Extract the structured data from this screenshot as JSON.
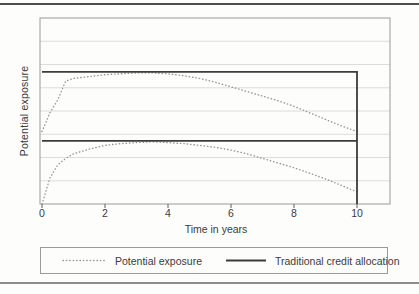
{
  "figure": {
    "y_axis_label": "Potential exposure",
    "x_axis_label": "Time in years"
  },
  "legend": {
    "position": "bottom",
    "items": [
      {
        "label": "Potential exposure",
        "style": "dotted"
      },
      {
        "label": "Traditional credit allocation",
        "style": "solid"
      }
    ]
  },
  "colors": {
    "background": "#fdfdfc",
    "top_rule": "#4d4d4d",
    "bottom_rule": "#8d8d8d",
    "frame": "#9a9a9a",
    "grid": "#dcdcd8",
    "dotted_line": "#979797",
    "solid_line": "#3c3c3c",
    "text": "#3b3b3b"
  },
  "chart_data": {
    "type": "line",
    "title": "",
    "xlabel": "Time in years",
    "ylabel": "Potential exposure",
    "xlim": [
      0,
      11
    ],
    "ylim": [
      0,
      100
    ],
    "x_ticks": [
      0,
      2,
      4,
      6,
      8,
      10
    ],
    "y_axis_numbers_shown": false,
    "y_divisions": 8,
    "grid": "horizontal",
    "legend_position": "bottom",
    "series": [
      {
        "name": "Potential exposure (upper profile)",
        "style": "dotted",
        "x": [
          0,
          0.25,
          0.5,
          0.75,
          1,
          1.5,
          2,
          2.5,
          3,
          3.5,
          4,
          4.5,
          5,
          5.5,
          6,
          6.5,
          7,
          7.5,
          8,
          8.5,
          9,
          9.5,
          10
        ],
        "y": [
          39,
          49,
          56,
          66,
          67.5,
          68.5,
          69.5,
          70,
          70.5,
          70.5,
          70,
          69,
          67.5,
          65.5,
          63,
          60.5,
          58,
          55.5,
          52.5,
          49,
          45.5,
          42,
          39
        ]
      },
      {
        "name": "Potential exposure (lower profile)",
        "style": "dotted",
        "x": [
          0,
          0.25,
          0.5,
          0.75,
          1,
          1.5,
          2,
          2.5,
          3,
          3.5,
          4,
          4.5,
          5,
          5.5,
          6,
          6.5,
          7,
          7.5,
          8,
          8.5,
          9,
          9.5,
          10
        ],
        "y": [
          0,
          14,
          21,
          24.5,
          27,
          29.5,
          31.5,
          32.5,
          33,
          33.5,
          33,
          32.5,
          31.5,
          30.5,
          29,
          27,
          24.5,
          22,
          19.5,
          16.5,
          13.5,
          10,
          6.5
        ]
      },
      {
        "name": "Traditional credit allocation (upper)",
        "style": "solid",
        "x": [
          0,
          10,
          10
        ],
        "y": [
          71,
          71,
          0
        ]
      },
      {
        "name": "Traditional credit allocation (lower)",
        "style": "solid",
        "x": [
          0,
          10
        ],
        "y": [
          34,
          34
        ]
      }
    ]
  }
}
